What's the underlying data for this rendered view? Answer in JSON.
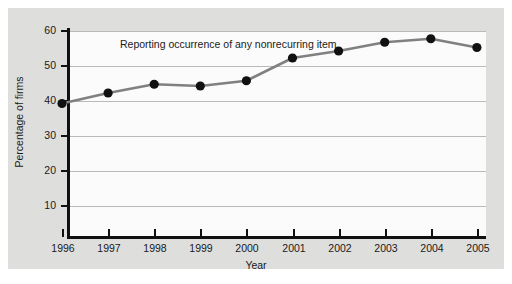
{
  "chart_data": {
    "type": "line",
    "title": "",
    "annotation": "Reporting occurrence of any nonrecurring item",
    "xlabel": "Year",
    "ylabel": "Percentage of firms",
    "categories": [
      "1996",
      "1997",
      "1998",
      "1999",
      "2000",
      "2001",
      "2002",
      "2003",
      "2004",
      "2005"
    ],
    "x": [
      1996,
      1997,
      1998,
      1999,
      2000,
      2001,
      2002,
      2003,
      2004,
      2005
    ],
    "values": [
      37,
      40,
      42.5,
      42,
      43.5,
      50,
      52,
      54.5,
      55.5,
      53
    ],
    "series": [
      {
        "name": "Reporting occurrence of any nonrecurring item",
        "values": [
          37,
          40,
          42.5,
          42,
          43.5,
          50,
          52,
          54.5,
          55.5,
          53
        ]
      }
    ],
    "ylim": [
      5,
      60
    ],
    "yticks": [
      10,
      20,
      30,
      40,
      50,
      60
    ],
    "ytick_labels": [
      "10",
      "20",
      "30",
      "40",
      "50",
      "60"
    ],
    "xlim": [
      1996,
      2005
    ],
    "grid": "horizontal",
    "legend": "none",
    "marker": "filled-circle",
    "line_color": "#808080",
    "marker_color": "#111111",
    "plot_background": "#fbfbfb",
    "panel_background": "#dededd",
    "gridline_color": "#b9b9b9"
  },
  "axes": {
    "y_tick_10": "10",
    "y_tick_20": "20",
    "y_tick_30": "30",
    "y_tick_40": "40",
    "y_tick_50": "50",
    "y_tick_60": "60",
    "x_tick_1996": "1996",
    "x_tick_1997": "1997",
    "x_tick_1998": "1998",
    "x_tick_1999": "1999",
    "x_tick_2000": "2000",
    "x_tick_2001": "2001",
    "x_tick_2002": "2002",
    "x_tick_2003": "2003",
    "x_tick_2004": "2004",
    "x_tick_2005": "2005"
  }
}
